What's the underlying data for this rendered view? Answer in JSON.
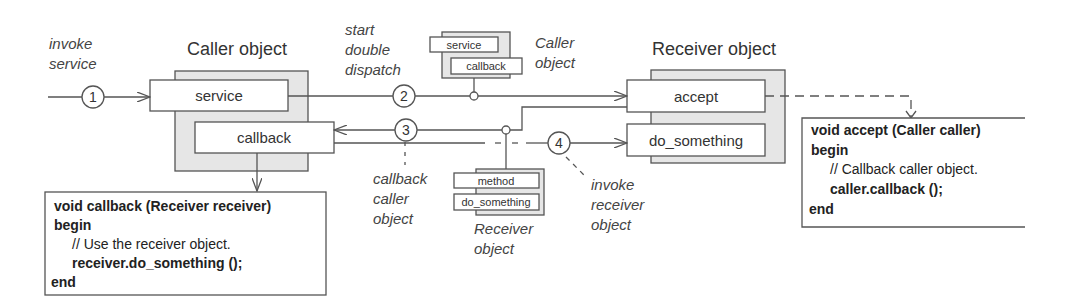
{
  "diagram": {
    "caller_object": {
      "title": "Caller object",
      "methods": [
        "service",
        "callback"
      ]
    },
    "receiver_object": {
      "title": "Receiver object",
      "methods": [
        "accept",
        "do_something"
      ]
    },
    "mini_caller": {
      "methods": [
        "service",
        "callback"
      ],
      "label_line1": "Caller",
      "label_line2": "object"
    },
    "mini_receiver": {
      "methods": [
        "method",
        "do_something"
      ],
      "label_line1": "Receiver",
      "label_line2": "object"
    },
    "steps": [
      {
        "number": "1",
        "label_lines": [
          "invoke",
          "service"
        ]
      },
      {
        "number": "2",
        "label_lines": [
          "start",
          "double",
          "dispatch"
        ]
      },
      {
        "number": "3",
        "label_lines": [
          "callback",
          "caller",
          "object"
        ]
      },
      {
        "number": "4",
        "label_lines": [
          "invoke",
          "receiver",
          "object"
        ]
      }
    ],
    "callback_code": {
      "signature": "void callback (Receiver receiver)",
      "begin": "begin",
      "comment": "// Use the receiver object.",
      "statement": "receiver.do_something ();",
      "end": "end"
    },
    "accept_code": {
      "signature": "void accept (Caller caller)",
      "begin": "begin",
      "comment": "// Callback caller object.",
      "statement": "caller.callback ();",
      "end": "end"
    }
  }
}
